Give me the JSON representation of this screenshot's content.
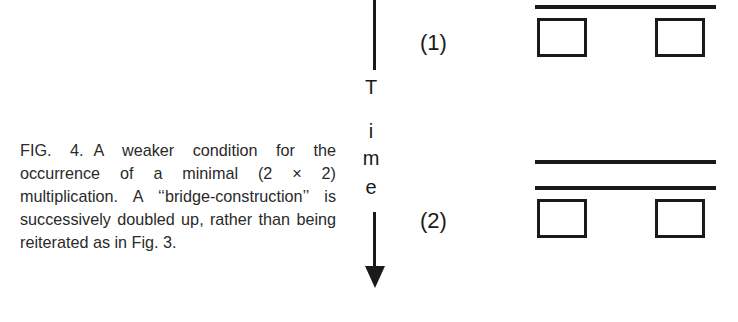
{
  "caption": {
    "figure_label": "FIG. 4.",
    "text": "A weaker condition for the occurrence of a minimal (2 × 2) multiplication. A ‘‘bridge-construction’’ is successively doubled up, rather than being reiterated as in Fig. 3."
  },
  "time_axis": {
    "letters": [
      "T",
      "i",
      "m",
      "e"
    ],
    "direction": "down"
  },
  "stages": [
    {
      "label": "(1)",
      "bars": 1,
      "boxes": 2
    },
    {
      "label": "(2)",
      "bars": 2,
      "boxes": 2
    }
  ]
}
